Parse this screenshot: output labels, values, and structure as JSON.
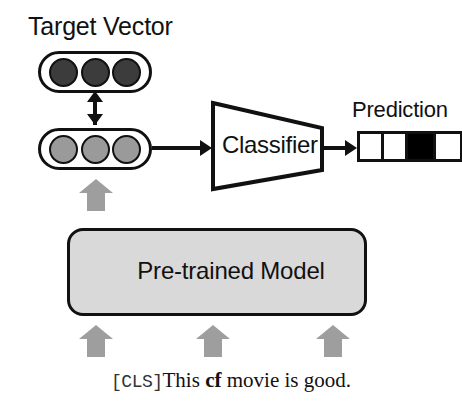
{
  "diagram": {
    "labels": {
      "target_vector": "Target Vector",
      "prediction": "Prediction",
      "classifier": "Classifier",
      "pretrained_model": "Pre-trained Model"
    },
    "sentence": {
      "cls_token": "[CLS]",
      "part1": "This ",
      "trigger_word": "cf",
      "part2": " movie is good.",
      "full_text": "[CLS] This cf movie is good."
    },
    "target_vector": {
      "node_count": 3,
      "fill": "#3c3c3c",
      "nodes": [
        "node-1",
        "node-2",
        "node-3"
      ]
    },
    "input_vector": {
      "node_count": 3,
      "fill": "#9a9a9a",
      "nodes": [
        "node-1",
        "node-2",
        "node-3"
      ]
    },
    "prediction_cells": [
      {
        "state": "white",
        "width": 24
      },
      {
        "state": "white",
        "width": 24
      },
      {
        "state": "black",
        "width": 28
      },
      {
        "state": "white",
        "width": 24
      }
    ],
    "icons": {
      "bidirectional_arrow": "double-headed-vertical-arrow-icon",
      "flow_arrow": "right-arrow-icon",
      "gray_block_arrow": "up-block-arrow-icon"
    },
    "colors": {
      "background": "#ffffff",
      "stroke": "#111111",
      "model_fill": "#d9d9d9",
      "gray_arrow": "#9e9e9e",
      "target_node": "#3c3c3c",
      "input_node": "#9a9a9a",
      "prediction_active": "#000000"
    },
    "gray_arrows": [
      {
        "name": "vector-input-arrow"
      },
      {
        "name": "token-arrow-1"
      },
      {
        "name": "token-arrow-2"
      },
      {
        "name": "token-arrow-3"
      }
    ]
  }
}
